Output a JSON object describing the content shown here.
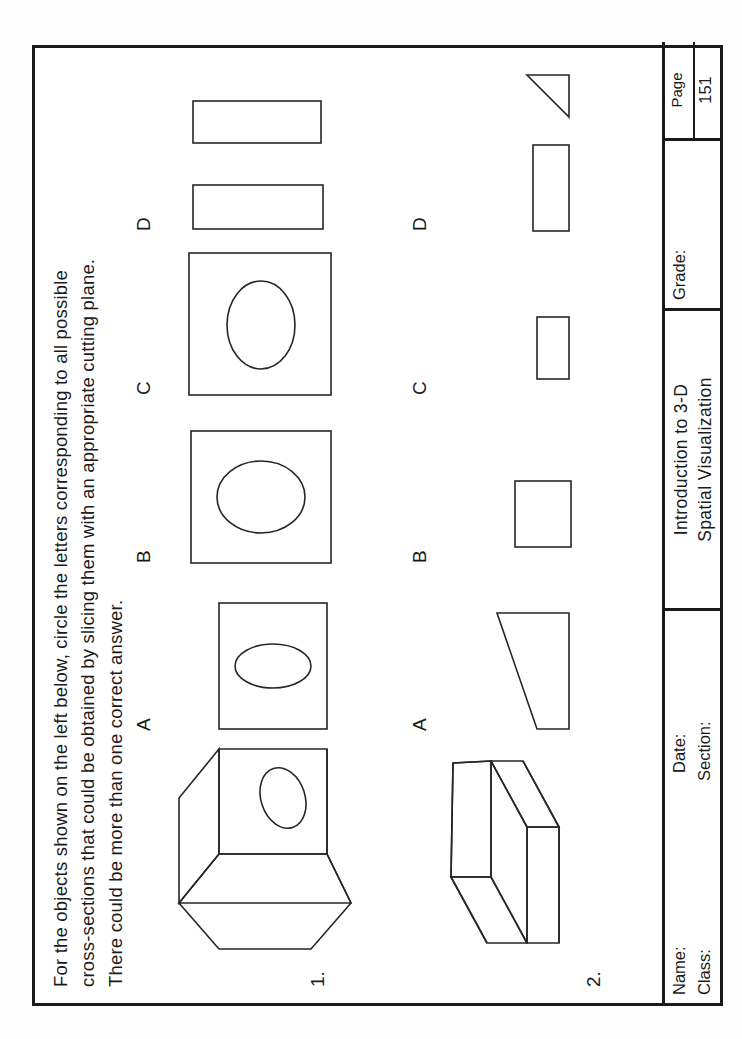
{
  "document": {
    "kind": "scanned-worksheet",
    "orientation": "rotated-90-ccw",
    "ink_color": "#262626",
    "paper_color": "#ffffff"
  },
  "instructions": {
    "text": "For the objects shown on the left below, circle the letters corresponding to all possible\ncross-sections that could be obtained by slicing them with an appropriate cutting plane.\nThere could be more than one correct answer."
  },
  "questions": [
    {
      "number": "1.",
      "object_name": "cube-with-ellipse-on-face",
      "options": [
        {
          "label": "A",
          "shape": "square-with-tall-narrow-ellipse"
        },
        {
          "label": "B",
          "shape": "square-with-round-ellipse"
        },
        {
          "label": "C",
          "shape": "square-with-wide-ellipse"
        },
        {
          "label": "D",
          "shape": "two-narrow-rectangles"
        }
      ]
    },
    {
      "number": "2.",
      "object_name": "bent-v-shaped-slab",
      "options": [
        {
          "label": "A",
          "shape": "right-trapezoid"
        },
        {
          "label": "B",
          "shape": "square"
        },
        {
          "label": "C",
          "shape": "small-rectangle"
        },
        {
          "label": "D",
          "shape": "rectangle-and-right-triangle"
        }
      ]
    }
  ],
  "footer": {
    "name_label": "Name:",
    "class_label": "Class:",
    "section_label": "Section:",
    "date_label": "Date:",
    "title_line_1": "Introduction to 3-D",
    "title_line_2": "Spatial Visualization",
    "grade_label": "Grade:",
    "page_label": "Page",
    "page_number": "151"
  }
}
